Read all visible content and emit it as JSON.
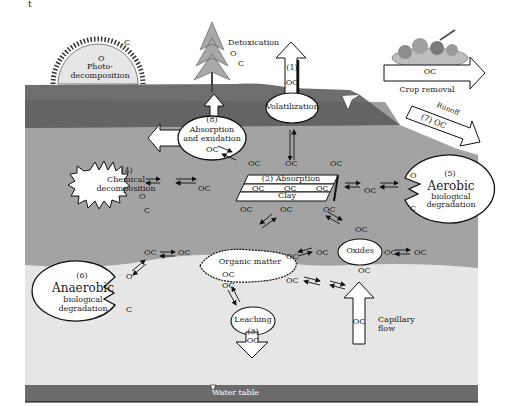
{
  "diagram": {
    "colors": {
      "sky": "#ffffff",
      "topsoil": "#6f6f6f",
      "subsoil": "#a0a0a0",
      "lower_soil": "#e4e4e4",
      "water_table": "#6b6b6b",
      "shape_fill": "#ffffff",
      "outline": "#111111"
    },
    "stray_text": "t",
    "processes": {
      "photodecomposition": {
        "line1": "Photo-",
        "line2": "decomposition",
        "o": "O",
        "c": "C"
      },
      "detoxication": {
        "label": "Detoxication",
        "o": "O",
        "c": "C"
      },
      "volatilization": {
        "number": "(1)",
        "oc": "OC",
        "label": "Volatilization"
      },
      "crop_removal": {
        "oc": "OC",
        "label": "Crop removal"
      },
      "runoff": {
        "label": "Runoff",
        "number_oc": "(7) OC"
      },
      "absorption_exudation": {
        "number": "(8)",
        "line1": "Absorption",
        "line2": "and exudation",
        "oc": "OC"
      },
      "chemical_decomposition": {
        "number": "(4)",
        "line1": "Chemical",
        "line2": "decomposition",
        "o": "O",
        "c": "C"
      },
      "absorption_clay": {
        "title": "(2) Absorption",
        "oc_row": [
          "OC",
          "OC",
          "OC"
        ],
        "clay": "Clay"
      },
      "aerobic": {
        "number": "(5)",
        "line1": "Aerobic",
        "line2": "biological",
        "line3": "degradation",
        "o": "O",
        "c": "C"
      },
      "oxides": {
        "label": "Oxides"
      },
      "organic_matter": {
        "label": "Organic matter",
        "oc1": "OC",
        "oc2": "OC"
      },
      "anaerobic": {
        "number": "(6)",
        "line1": "Anaerobic",
        "line2": "biological",
        "line3": "degradation",
        "o": "O",
        "c": "C"
      },
      "leaching": {
        "label": "Leaching",
        "number": "(3)",
        "oc": "OC"
      },
      "capillary_flow": {
        "oc": "OC",
        "line1": "Capillary",
        "line2": "flow"
      },
      "water_table": {
        "label": "Water table"
      }
    },
    "floating_oc": "OC"
  }
}
